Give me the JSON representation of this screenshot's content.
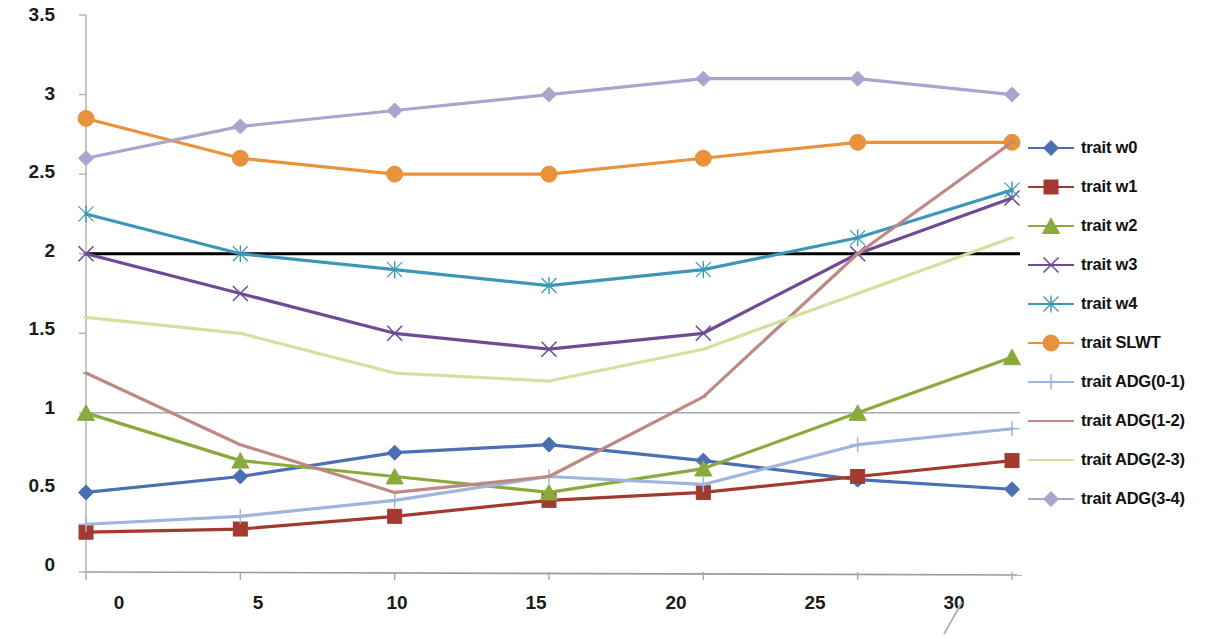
{
  "chart_data": {
    "type": "line",
    "title": "",
    "xlabel": "",
    "ylabel": "",
    "x": [
      0,
      5,
      10,
      15,
      20,
      25,
      30
    ],
    "xticklabels": [
      "0",
      "5",
      "10",
      "15",
      "20",
      "25",
      "30"
    ],
    "yticklabels": [
      "0",
      "0.5",
      "1",
      "1.5",
      "2",
      "2.5",
      "3",
      "3.5"
    ],
    "ylim": [
      0,
      3.5
    ],
    "xlim": [
      0,
      30
    ],
    "grid": "horizontal-partial",
    "legend_position": "right",
    "gridlines": [
      {
        "value": 2,
        "color": "#000000",
        "width": 3
      },
      {
        "value": 1,
        "color": "#808080",
        "width": 1
      }
    ],
    "series": [
      {
        "name": "trait w0",
        "color": "#4a6fb5",
        "marker": "diamond",
        "values": [
          0.5,
          0.6,
          0.75,
          0.8,
          0.7,
          0.58,
          0.52
        ]
      },
      {
        "name": "trait w1",
        "color": "#a33a30",
        "marker": "square",
        "values": [
          0.25,
          0.27,
          0.35,
          0.45,
          0.5,
          0.6,
          0.7
        ]
      },
      {
        "name": "trait w2",
        "color": "#8aaa3c",
        "marker": "triangle",
        "values": [
          1.0,
          0.7,
          0.6,
          0.5,
          0.65,
          1.0,
          1.35
        ]
      },
      {
        "name": "trait w3",
        "color": "#6f4b96",
        "marker": "x",
        "values": [
          2.0,
          1.75,
          1.5,
          1.4,
          1.5,
          2.0,
          2.35
        ]
      },
      {
        "name": "trait w4",
        "color": "#3d96b8",
        "marker": "asterisk",
        "values": [
          2.25,
          2.0,
          1.9,
          1.8,
          1.9,
          2.1,
          2.4
        ]
      },
      {
        "name": "trait SLWT",
        "color": "#e8923c",
        "marker": "circle",
        "values": [
          2.85,
          2.6,
          2.5,
          2.5,
          2.6,
          2.7,
          2.7
        ]
      },
      {
        "name": "trait ADG(0-1)",
        "color": "#9fb5dd",
        "marker": "plus",
        "values": [
          0.3,
          0.35,
          0.45,
          0.6,
          0.55,
          0.8,
          0.9
        ]
      },
      {
        "name": "trait ADG(1-2)",
        "color": "#bf8983",
        "marker": "dash",
        "values": [
          1.25,
          0.8,
          0.5,
          0.6,
          1.1,
          2.0,
          2.7
        ]
      },
      {
        "name": "trait ADG(2-3)",
        "color": "#d3e0a0",
        "marker": "dash",
        "values": [
          1.6,
          1.5,
          1.25,
          1.2,
          1.4,
          1.75,
          2.1
        ]
      },
      {
        "name": "trait ADG(3-4)",
        "color": "#a9a5cf",
        "marker": "diamond",
        "values": [
          2.6,
          2.8,
          2.9,
          3.0,
          3.1,
          3.1,
          3.0
        ]
      }
    ]
  },
  "axes": {
    "y_ticks": [
      "3.5",
      "3",
      "2.5",
      "2",
      "1.5",
      "1",
      "0.5",
      "0"
    ],
    "x_ticks": [
      "0",
      "5",
      "10",
      "15",
      "20",
      "25",
      "30"
    ]
  },
  "legend": {
    "items": [
      {
        "label": "trait w0"
      },
      {
        "label": "trait w1"
      },
      {
        "label": "trait w2"
      },
      {
        "label": "trait w3"
      },
      {
        "label": "trait w4"
      },
      {
        "label": "trait SLWT"
      },
      {
        "label": "trait ADG(0-1)"
      },
      {
        "label": "trait ADG(1-2)"
      },
      {
        "label": "trait ADG(2-3)"
      },
      {
        "label": "trait ADG(3-4)"
      }
    ]
  }
}
